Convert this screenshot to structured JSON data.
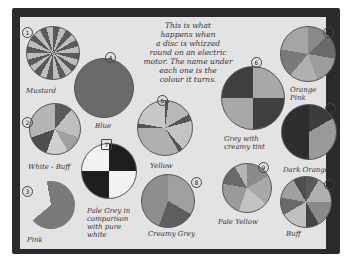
{
  "poster": {
    "description_lines": [
      "This is what",
      "happens when",
      "a disc is whizzed",
      "round on an electric",
      "motor. The name under",
      "each one is the",
      "colour it turns."
    ]
  },
  "discs": [
    {
      "number": "1",
      "label": "Mustard"
    },
    {
      "number": "2",
      "label": "White - Buff"
    },
    {
      "number": "3",
      "label": "Pink"
    },
    {
      "number": "4",
      "label": "Blue"
    },
    {
      "number": "5",
      "label": "Yellow"
    },
    {
      "number": "6",
      "label": "Grey with creamy tint"
    },
    {
      "number": "7",
      "label": "Pale Grey in comparison with pure white"
    },
    {
      "number": "8",
      "label": "Creamy Grey"
    },
    {
      "number": "9",
      "label": "Pale Yellow"
    },
    {
      "number": "10",
      "label": "Orange Pink"
    },
    {
      "number": "11",
      "label": "Dark Orange"
    },
    {
      "number": "12",
      "label": "Buff"
    }
  ],
  "colors": {
    "board": "#2b2b2b",
    "paper": "#e3e3e3",
    "ink": "#333333"
  }
}
